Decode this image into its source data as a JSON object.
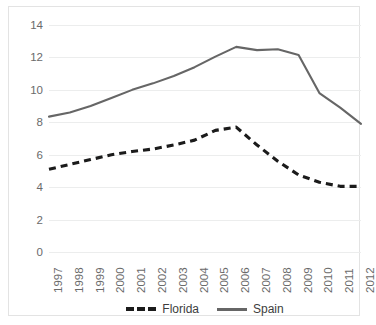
{
  "chart_data": {
    "type": "line",
    "title": "",
    "subtitle": "",
    "xlabel": "",
    "ylabel": "",
    "x": [
      1997,
      1998,
      1999,
      2000,
      2001,
      2002,
      2003,
      2004,
      2005,
      2006,
      2007,
      2008,
      2009,
      2010,
      2011,
      2012
    ],
    "categories": [
      "1997",
      "1998",
      "1999",
      "2000",
      "2001",
      "2002",
      "2003",
      "2004",
      "2005",
      "2006",
      "2007",
      "2008",
      "2009",
      "2010",
      "2011",
      "2012"
    ],
    "series": [
      {
        "name": "Florida",
        "style": "dashed",
        "color": "#1b1b1b",
        "values": [
          5.1,
          5.4,
          5.7,
          6.0,
          6.2,
          6.35,
          6.6,
          6.9,
          7.5,
          7.7,
          6.6,
          5.6,
          4.75,
          4.3,
          4.05,
          4.05
        ]
      },
      {
        "name": "Spain",
        "style": "solid",
        "color": "#666666",
        "values": [
          8.35,
          8.6,
          9.0,
          9.5,
          10.0,
          10.4,
          10.85,
          11.4,
          12.05,
          12.65,
          12.45,
          12.5,
          12.15,
          9.8,
          8.9,
          7.9
        ]
      }
    ],
    "ylim": [
      0,
      14
    ],
    "ytick_step": 2,
    "yticks": [
      14,
      12,
      10,
      8,
      6,
      4,
      2,
      0
    ],
    "ytick_labels": [
      "14",
      "12",
      "10",
      "8",
      "6",
      "4",
      "2",
      "0"
    ],
    "grid": true,
    "grid_axis": "y",
    "grid_color": "#eceded",
    "legend_position": "bottom",
    "xtick_rotation": -90,
    "background_color": "#ffffff",
    "border_color": "#e3e3e3"
  },
  "legend": {
    "entries": [
      {
        "label": "Florida",
        "style": "dashed"
      },
      {
        "label": "Spain",
        "style": "solid"
      }
    ]
  }
}
